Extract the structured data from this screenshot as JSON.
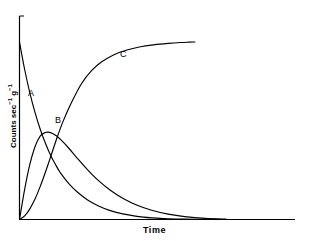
{
  "chart_data": {
    "type": "line",
    "title": "",
    "subtitle": "",
    "xlabel": "Time",
    "ylabel": "Counts sec⁻¹ g⁻¹",
    "ylabel_parts": {
      "base1": "Counts sec",
      "exp1": "−1",
      "base2": " g",
      "exp2": "−1"
    },
    "grid": false,
    "legend_position": "inline-curve-labels",
    "axis_ticks_labeled": false,
    "xlim": [
      0,
      1
    ],
    "ylim": [
      0,
      1
    ],
    "line_color": "#000000",
    "axis_color": "#000000",
    "background_color": "#ffffff",
    "annotations": [
      {
        "text": "A",
        "x": 0.043,
        "y": 0.705
      },
      {
        "text": "B",
        "x": 0.141,
        "y": 0.54
      },
      {
        "text": "C",
        "x": 0.377,
        "y": 0.92
      }
    ],
    "series": [
      {
        "name": "A",
        "label": "A",
        "description": "exponential decay of parent nuclide",
        "x": [
          0.0,
          0.025,
          0.05,
          0.075,
          0.1,
          0.125,
          0.15,
          0.175,
          0.2,
          0.24,
          0.28,
          0.33,
          0.38,
          0.44,
          0.5,
          0.6,
          0.7,
          0.8,
          0.9,
          1.0
        ],
        "y": [
          1.0,
          0.845,
          0.714,
          0.604,
          0.51,
          0.431,
          0.364,
          0.308,
          0.26,
          0.201,
          0.155,
          0.11,
          0.078,
          0.05,
          0.032,
          0.013,
          0.005,
          0.002,
          0.001,
          0.0
        ]
      },
      {
        "name": "B",
        "label": "B",
        "description": "growth and decay of intermediate daughter",
        "x": [
          0.0,
          0.025,
          0.05,
          0.075,
          0.1,
          0.125,
          0.14,
          0.16,
          0.18,
          0.2,
          0.24,
          0.28,
          0.33,
          0.38,
          0.44,
          0.5,
          0.57,
          0.64,
          0.72,
          0.8,
          0.9,
          1.0
        ],
        "y": [
          0.0,
          0.17,
          0.31,
          0.41,
          0.47,
          0.49,
          0.492,
          0.485,
          0.47,
          0.45,
          0.4,
          0.345,
          0.28,
          0.222,
          0.165,
          0.12,
          0.08,
          0.052,
          0.03,
          0.016,
          0.006,
          0.002
        ]
      },
      {
        "name": "C",
        "label": "C",
        "description": "accumulation of stable end product to saturation",
        "x": [
          0.0,
          0.025,
          0.05,
          0.075,
          0.1,
          0.125,
          0.15,
          0.18,
          0.21,
          0.25,
          0.3,
          0.35,
          0.4,
          0.46,
          0.52,
          0.58,
          0.65,
          0.72,
          0.78,
          0.82,
          0.85
        ],
        "y": [
          0.0,
          0.02,
          0.06,
          0.115,
          0.185,
          0.265,
          0.35,
          0.455,
          0.55,
          0.655,
          0.765,
          0.84,
          0.89,
          0.93,
          0.955,
          0.972,
          0.984,
          0.992,
          0.997,
          0.999,
          1.0
        ]
      }
    ]
  },
  "axes": {
    "y_axis_name": "y-axis",
    "x_axis_name": "x-axis",
    "x_title": "Time",
    "y_title": "Counts sec⁻¹ g⁻¹"
  }
}
